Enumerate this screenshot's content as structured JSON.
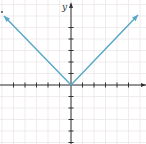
{
  "chart_data": {
    "type": "line",
    "title": "",
    "function": "y = |x|",
    "xlabel": "",
    "ylabel": "y",
    "xlim": [
      -6,
      6
    ],
    "ylim": [
      -5,
      6
    ],
    "grid": true,
    "series": [
      {
        "name": "y = |x|",
        "color": "#5aa8c8",
        "x": [
          -6,
          -5,
          -4,
          -3,
          -2,
          -1,
          0,
          1,
          2,
          3,
          4,
          5,
          6
        ],
        "values": [
          6,
          5,
          4,
          3,
          2,
          1,
          0,
          1,
          2,
          3,
          4,
          5,
          6
        ]
      }
    ],
    "arrows_at_ends": true,
    "x_ticks": [
      -5,
      -4,
      -3,
      -2,
      -1,
      1,
      2,
      3,
      4,
      5
    ],
    "y_ticks": [
      -5,
      -4,
      -3,
      -2,
      -1,
      1,
      2,
      3,
      4,
      5
    ]
  },
  "colors": {
    "line": "#5aa8c8",
    "axis": "#333333",
    "grid": "#ece6ea"
  },
  "labels": {
    "y_axis": "y"
  }
}
